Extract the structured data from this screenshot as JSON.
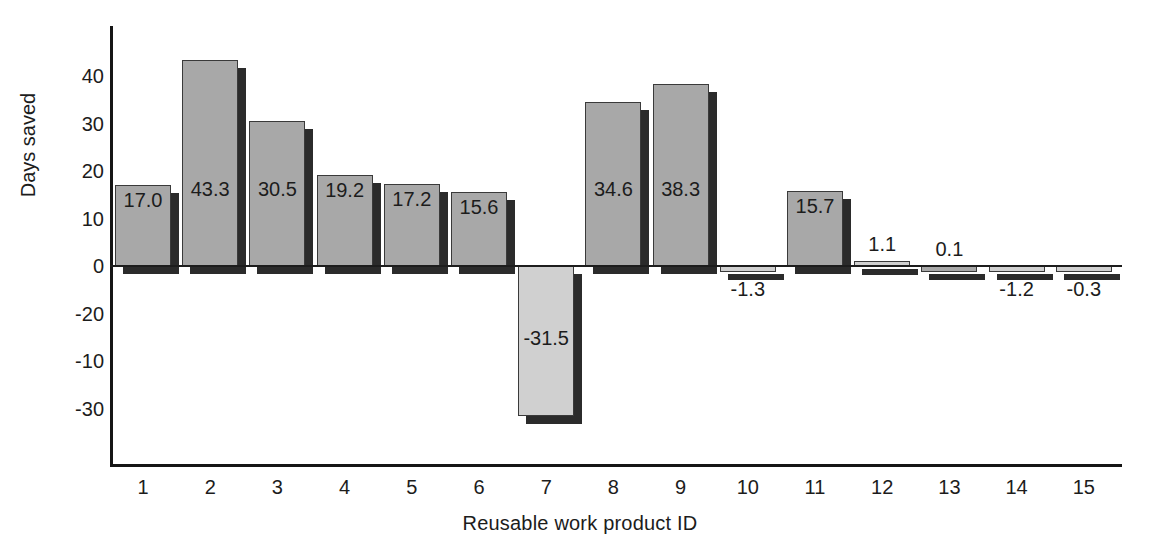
{
  "chart_data": {
    "type": "bar",
    "title": "",
    "xlabel": "Reusable work product ID",
    "ylabel": "Days saved",
    "categories": [
      "1",
      "2",
      "3",
      "4",
      "5",
      "6",
      "7",
      "8",
      "9",
      "10",
      "11",
      "12",
      "13",
      "14",
      "15"
    ],
    "values": [
      17.0,
      43.3,
      30.5,
      19.2,
      17.2,
      15.6,
      -31.5,
      34.6,
      38.3,
      -1.3,
      15.7,
      1.1,
      0.1,
      -1.2,
      -0.3
    ],
    "value_labels": [
      "17.0",
      "43.3",
      "30.5",
      "19.2",
      "17.2",
      "15.6",
      "-31.5",
      "34.6",
      "38.3",
      "-1.3",
      "15.7",
      "1.1",
      "0.1",
      "-1.2",
      "-0.3"
    ],
    "bar_shades": [
      "dark",
      "dark",
      "dark",
      "dark",
      "dark",
      "dark",
      "light",
      "dark",
      "dark",
      "light",
      "dark",
      "light",
      "dark",
      "light",
      "light"
    ],
    "y_tick_labels": [
      "40",
      "30",
      "20",
      "10",
      "0",
      "-20",
      "-10",
      "-30"
    ],
    "y_tick_positions": [
      40,
      30,
      20,
      10,
      0,
      -10,
      -20,
      -30
    ],
    "ylim": [
      -40,
      46
    ],
    "grid": false,
    "legend": null,
    "colors": {
      "bar_dark": "#a8a8a8",
      "bar_light": "#d0d0d0",
      "bar_edge": "#3a3a3a",
      "bar_shadow": "#2b2b2b",
      "axis": "#151515",
      "text": "#1c1c1c",
      "background": "#ffffff"
    }
  },
  "axes": {
    "y_title": "Days saved",
    "x_title": "Reusable work product ID"
  }
}
